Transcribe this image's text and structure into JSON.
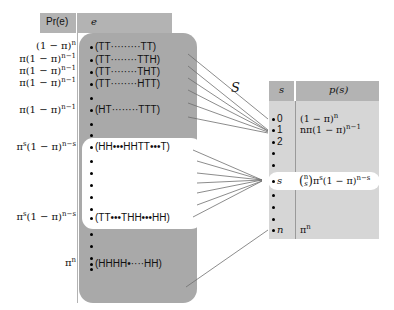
{
  "left_table": {
    "header_prob": "Pr(e)",
    "header_event": "e",
    "probabilities": [
      {
        "base": "(1 − π)",
        "exp": "n",
        "y": 71
      },
      {
        "base": "π(1 − π)",
        "exp": "n−1",
        "y": 83
      },
      {
        "base": "π(1 − π)",
        "exp": "n−1",
        "y": 95
      },
      {
        "base": "π(1 − π)",
        "exp": "n−1",
        "y": 107
      },
      {
        "base": "π(1 − π)",
        "exp": "n−1",
        "y": 130
      },
      {
        "base": "π",
        "exp": "s",
        "tail": "(1 − π)",
        "exp2": "n−s",
        "y": 154
      },
      {
        "base": "π",
        "exp": "s",
        "tail": "(1 − π)",
        "exp2": "n−s",
        "y": 224
      },
      {
        "base": "π",
        "exp": "n",
        "y": 293
      }
    ],
    "events": [
      {
        "label": "(TT·········TT)",
        "y": 71
      },
      {
        "label": "(TT········TTH)",
        "y": 83
      },
      {
        "label": "(TT········THT)",
        "y": 95
      },
      {
        "label": "(TT········HTT)",
        "y": 107
      },
      {
        "label": "",
        "y": 119
      },
      {
        "label": "(HT········TTT)",
        "y": 130
      },
      {
        "label": "",
        "y": 142
      },
      {
        "label": "",
        "y": 154
      },
      {
        "label": "(HH•••HHTT•••T)",
        "y": 166
      },
      {
        "label": "",
        "y": 178
      },
      {
        "label": "",
        "y": 190
      },
      {
        "label": "",
        "y": 202
      },
      {
        "label": "",
        "y": 213
      },
      {
        "label": "",
        "y": 225
      },
      {
        "label": "(TT•••THH•••HH)",
        "y": 237
      },
      {
        "label": "",
        "y": 248
      },
      {
        "label": "",
        "y": 260
      },
      {
        "label": "",
        "y": 271
      },
      {
        "label": "",
        "y": 283
      },
      {
        "label": "(HHHH•····HH)",
        "y": 291
      }
    ]
  },
  "mapping_label": "S",
  "right_table": {
    "header_s": "s",
    "header_ps": "p(s)",
    "rows": [
      {
        "s": "0",
        "ps_base": "(1 − π)",
        "ps_exp": "n",
        "y": 120
      },
      {
        "s": "1",
        "ps_base": "nπ(1 − π)",
        "ps_exp": "n−1",
        "y": 132
      },
      {
        "s": "2",
        "ps_base": "",
        "ps_exp": "",
        "y": 144
      },
      {
        "s": "",
        "ps_base": "",
        "ps_exp": "",
        "y": 156
      },
      {
        "s": "",
        "ps_base": "",
        "ps_exp": "",
        "y": 167
      },
      {
        "s": "s",
        "ps_base": "π",
        "ps_exp": "s",
        "y": 181
      },
      {
        "s": "",
        "ps_base": "",
        "ps_exp": "",
        "y": 194
      },
      {
        "s": "",
        "ps_base": "",
        "ps_exp": "",
        "y": 206
      },
      {
        "s": "",
        "ps_base": "",
        "ps_exp": "",
        "y": 218
      },
      {
        "s": "n",
        "ps_base": "π",
        "ps_exp": "n",
        "y": 230
      }
    ],
    "binom_top": "n",
    "binom_bottom": "s",
    "highlight_tail_base": "(1 − π)",
    "highlight_tail_exp": "n−s"
  },
  "colors": {
    "header_gray": "#b3b3b3",
    "panel_gray": "#a9a9a9",
    "right_panel": "#d6d6d6",
    "line": "#6e6e6e"
  }
}
